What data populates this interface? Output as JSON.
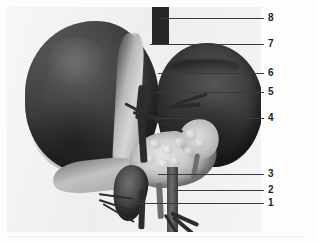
{
  "figure": {
    "kind": "anatomical-photograph",
    "background_color": "#fdfdfd",
    "plate_color": "#f0f0f0",
    "line_color": "#3a3a3a",
    "label_color": "#1d1d1d"
  },
  "labels": [
    {
      "id": "label-8",
      "text": "8",
      "num_x": 268,
      "num_y": 13,
      "line_x": 160,
      "line_y": 18,
      "line_w": 104
    },
    {
      "id": "label-7",
      "text": "7",
      "num_x": 268,
      "num_y": 39,
      "line_x": 150,
      "line_y": 44,
      "line_w": 114
    },
    {
      "id": "label-6",
      "text": "6",
      "num_x": 268,
      "num_y": 68,
      "line_x": 158,
      "line_y": 73,
      "line_w": 106
    },
    {
      "id": "label-5",
      "text": "5",
      "num_x": 268,
      "num_y": 87,
      "line_x": 155,
      "line_y": 92,
      "line_w": 109
    },
    {
      "id": "label-4",
      "text": "4",
      "num_x": 268,
      "num_y": 113,
      "line_x": 155,
      "line_y": 118,
      "line_w": 109
    },
    {
      "id": "label-3",
      "text": "3",
      "num_x": 268,
      "num_y": 169,
      "line_x": 158,
      "line_y": 174,
      "line_w": 106
    },
    {
      "id": "label-2",
      "text": "2",
      "num_x": 268,
      "num_y": 185,
      "line_x": 174,
      "line_y": 190,
      "line_w": 90
    },
    {
      "id": "label-1",
      "text": "1",
      "num_x": 268,
      "num_y": 198,
      "line_x": 130,
      "line_y": 203,
      "line_w": 134
    }
  ]
}
